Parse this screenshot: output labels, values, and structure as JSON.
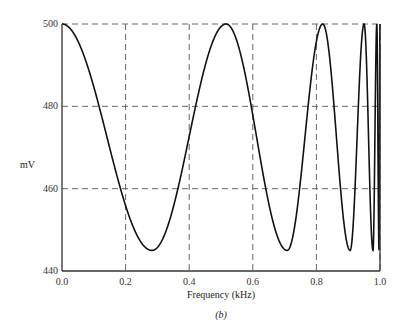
{
  "chart_data": {
    "type": "line",
    "title": "",
    "xlabel": "Frequency (kHz)",
    "ylabel": "mV",
    "caption": "(b)",
    "xlim": [
      0.0,
      1.0
    ],
    "ylim": [
      440,
      500
    ],
    "xticks": [
      "0.0",
      "0.2",
      "0.4",
      "0.6",
      "0.8",
      "1.0"
    ],
    "yticks": [
      "440",
      "460",
      "480",
      "500"
    ],
    "grid": true,
    "grid_style": "dashed",
    "legend": null,
    "series": [
      {
        "name": "response",
        "color": "#111111",
        "x": [
          0.0,
          0.283,
          0.516,
          0.708,
          0.82,
          0.906,
          0.95,
          0.978,
          0.99,
          0.997,
          1.0
        ],
        "y": [
          500,
          445,
          500,
          445,
          500,
          445,
          500,
          445,
          500,
          445,
          500
        ],
        "extrema_note": "oscillation between ~445 mV and 500 mV with increasing frequency toward 1.0 kHz"
      }
    ]
  },
  "labels": {
    "y_axis": "mV",
    "x_axis": "Frequency (kHz)",
    "caption": "(b)"
  }
}
